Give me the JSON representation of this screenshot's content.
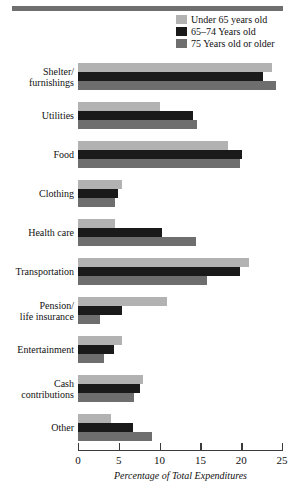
{
  "chart_data": {
    "type": "bar",
    "orientation": "horizontal",
    "title": "",
    "xlabel": "Percentage of Total Expenditures",
    "ylabel": "",
    "xlim": [
      0,
      25
    ],
    "xticks": [
      0,
      5,
      10,
      15,
      20,
      25
    ],
    "grid": false,
    "legend_position": "top-right",
    "categories": [
      "Shelter/\nfurnishings",
      "Utilities",
      "Food",
      "Clothing",
      "Health care",
      "Transportation",
      "Pension/\nlife insurance",
      "Entertainment",
      "Cash\ncontributions",
      "Other"
    ],
    "series": [
      {
        "name": "Under 65 years old",
        "color": "#b2b2b2",
        "values": [
          23.8,
          10.0,
          18.4,
          5.4,
          4.5,
          21.0,
          10.9,
          5.4,
          8.0,
          4.1
        ]
      },
      {
        "name": "65–74 Years old",
        "color": "#1a1a1a",
        "values": [
          22.7,
          14.1,
          20.1,
          4.9,
          10.3,
          19.9,
          5.4,
          4.4,
          7.6,
          6.8
        ]
      },
      {
        "name": "75 Years old or older",
        "color": "#6e6e6e",
        "values": [
          24.3,
          14.6,
          19.9,
          4.5,
          14.5,
          15.8,
          2.7,
          3.2,
          6.9,
          9.1
        ]
      }
    ]
  },
  "legend": {
    "items": [
      {
        "label": "Under 65 years old",
        "color": "#b2b2b2"
      },
      {
        "label": "65–74 Years old",
        "color": "#1a1a1a"
      },
      {
        "label": "75 Years old or older",
        "color": "#6e6e6e"
      }
    ]
  },
  "axis": {
    "tick_labels": [
      "0",
      "5",
      "10",
      "15",
      "20",
      "25"
    ],
    "title": "Percentage of Total Expenditures"
  },
  "category_labels": [
    [
      "Shelter/",
      "furnishings"
    ],
    [
      "Utilities"
    ],
    [
      "Food"
    ],
    [
      "Clothing"
    ],
    [
      "Health care"
    ],
    [
      "Transportation"
    ],
    [
      "Pension/",
      "life insurance"
    ],
    [
      "Entertainment"
    ],
    [
      "Cash",
      "contributions"
    ],
    [
      "Other"
    ]
  ],
  "colors": {
    "rule": "#6f6f6f",
    "axis": "#3a3a3a",
    "background": "#ffffff"
  }
}
